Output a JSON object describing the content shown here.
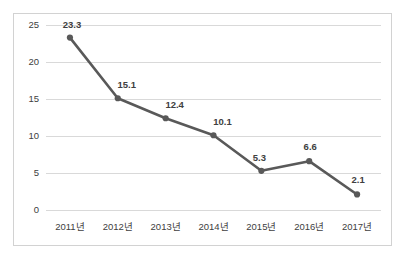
{
  "chart_data": {
    "type": "line",
    "title": "",
    "subtitle": "",
    "xlabel": "",
    "ylabel": "",
    "categories": [
      "2011년",
      "2012년",
      "2013년",
      "2014년",
      "2015년",
      "2016년",
      "2017년"
    ],
    "values": [
      23.3,
      15.1,
      12.4,
      10.1,
      5.3,
      6.6,
      2.1
    ],
    "point_labels": [
      "23.3",
      "15.1",
      "12.4",
      "10.1",
      "5.3",
      "6.6",
      "2.1"
    ],
    "series": [
      {
        "name": "",
        "values": [
          23.3,
          15.1,
          12.4,
          10.1,
          5.3,
          6.6,
          2.1
        ]
      }
    ],
    "ylim": [
      0,
      25
    ],
    "ytick_values": [
      0,
      5,
      10,
      15,
      20,
      25
    ],
    "ytick_labels": [
      "0",
      "5",
      "10",
      "15",
      "20",
      "25"
    ],
    "grid": true,
    "grid_axis": "y",
    "legend": false,
    "legend_position": "none",
    "markers": true
  },
  "style": {
    "line_color": "#595959",
    "marker_color": "#595959",
    "grid_color": "#d9d9d9",
    "text_color": "#404040",
    "border_color": "#d2d2d2",
    "background_color": "#ffffff"
  }
}
